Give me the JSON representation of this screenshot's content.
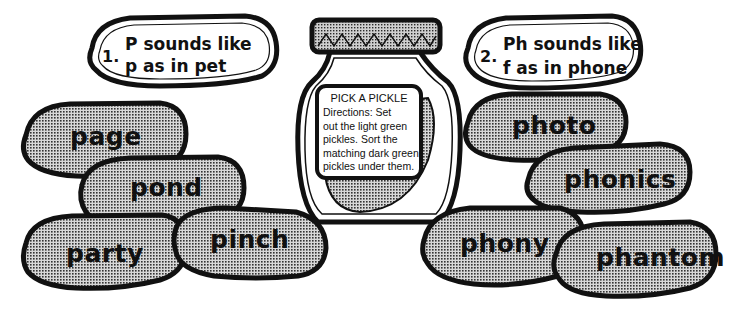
{
  "title": "Pick a Pickle",
  "jar": {
    "label_title": "PICK A PICKLE",
    "directions": [
      "Directions: Set",
      "out the light green",
      "pickles. Sort the",
      "matching dark green",
      "pickles under them."
    ]
  },
  "headers": [
    {
      "number": "1.",
      "line1": "P sounds like",
      "line2": "p as in pet"
    },
    {
      "number": "2.",
      "line1": "Ph sounds like",
      "line2": "f as in phone"
    }
  ],
  "left_pickles": [
    "page",
    "pond",
    "party",
    "pinch"
  ],
  "right_pickles": [
    "photo",
    "phonics",
    "phony",
    "phantom"
  ],
  "colors": {
    "outline": "#111111",
    "pickle_fill": "#9a9a9a",
    "header_fill": "#ffffff",
    "background": "#ffffff"
  }
}
